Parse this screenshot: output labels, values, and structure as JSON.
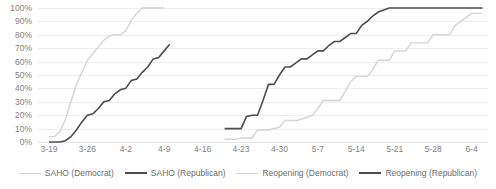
{
  "chart_data": {
    "type": "line",
    "title": "",
    "subtitle": "",
    "xlabel": "",
    "ylabel": "",
    "grid": true,
    "legend_position": "bottom",
    "ylim": [
      0,
      100
    ],
    "y_ticks": [
      "0%",
      "10%",
      "20%",
      "30%",
      "40%",
      "50%",
      "60%",
      "70%",
      "80%",
      "90%",
      "100%"
    ],
    "y_tick_values": [
      0,
      10,
      20,
      30,
      40,
      50,
      60,
      70,
      80,
      90,
      100
    ],
    "x_ticks": [
      "3-19",
      "3-26",
      "4-2",
      "4-9",
      "4-16",
      "4-23",
      "4-30",
      "5-7",
      "5-14",
      "5-21",
      "5-28",
      "6-4"
    ],
    "x_tick_values": [
      0,
      7,
      14,
      21,
      28,
      35,
      42,
      49,
      56,
      63,
      70,
      77
    ],
    "xlim": [
      -2,
      80
    ],
    "series": [
      {
        "name": "SAHO (Democrat)",
        "color": "#d4d4d4",
        "points": [
          [
            0,
            4
          ],
          [
            1,
            4
          ],
          [
            2,
            8
          ],
          [
            3,
            17
          ],
          [
            4,
            30
          ],
          [
            5,
            43
          ],
          [
            6,
            52
          ],
          [
            7,
            61
          ],
          [
            8,
            66
          ],
          [
            9,
            71
          ],
          [
            10,
            76
          ],
          [
            11,
            79
          ],
          [
            12,
            80
          ],
          [
            13,
            80
          ],
          [
            14,
            83
          ],
          [
            15,
            91
          ],
          [
            16,
            96
          ],
          [
            17,
            100
          ],
          [
            18,
            100
          ],
          [
            19,
            100
          ],
          [
            20,
            100
          ],
          [
            21,
            100
          ]
        ]
      },
      {
        "name": "SAHO (Republican)",
        "color": "#4d4d4d",
        "points": [
          [
            0,
            0
          ],
          [
            1,
            0
          ],
          [
            2,
            0
          ],
          [
            3,
            1
          ],
          [
            4,
            4
          ],
          [
            5,
            9
          ],
          [
            6,
            15
          ],
          [
            7,
            20
          ],
          [
            8,
            21
          ],
          [
            9,
            25
          ],
          [
            10,
            30
          ],
          [
            11,
            31
          ],
          [
            12,
            36
          ],
          [
            13,
            39
          ],
          [
            14,
            40
          ],
          [
            15,
            46
          ],
          [
            16,
            47
          ],
          [
            17,
            52
          ],
          [
            18,
            56
          ],
          [
            19,
            62
          ],
          [
            20,
            63
          ],
          [
            21,
            68
          ],
          [
            22,
            73
          ]
        ]
      },
      {
        "name": "Reopening (Democrat)",
        "color": "#d4d4d4",
        "points": [
          [
            32,
            2
          ],
          [
            34,
            2
          ],
          [
            35,
            3
          ],
          [
            37,
            3
          ],
          [
            38,
            9
          ],
          [
            40,
            9
          ],
          [
            42,
            11
          ],
          [
            43,
            16
          ],
          [
            45,
            16
          ],
          [
            46,
            17
          ],
          [
            48,
            20
          ],
          [
            49,
            25
          ],
          [
            50,
            31
          ],
          [
            51,
            31
          ],
          [
            53,
            31
          ],
          [
            54,
            38
          ],
          [
            55,
            45
          ],
          [
            56,
            49
          ],
          [
            58,
            49
          ],
          [
            59,
            54
          ],
          [
            60,
            61
          ],
          [
            62,
            61
          ],
          [
            63,
            68
          ],
          [
            65,
            68
          ],
          [
            66,
            74
          ],
          [
            69,
            74
          ],
          [
            70,
            80
          ],
          [
            73,
            80
          ],
          [
            74,
            87
          ],
          [
            76,
            93
          ],
          [
            77,
            96
          ],
          [
            79,
            96
          ]
        ]
      },
      {
        "name": "Reopening (Republican)",
        "color": "#4d4d4d",
        "points": [
          [
            32,
            10
          ],
          [
            34,
            10
          ],
          [
            35,
            10
          ],
          [
            36,
            19
          ],
          [
            37,
            20
          ],
          [
            38,
            20
          ],
          [
            39,
            31
          ],
          [
            40,
            43
          ],
          [
            41,
            43
          ],
          [
            42,
            50
          ],
          [
            43,
            56
          ],
          [
            44,
            56
          ],
          [
            45,
            59
          ],
          [
            46,
            62
          ],
          [
            47,
            62
          ],
          [
            48,
            65
          ],
          [
            49,
            68
          ],
          [
            50,
            68
          ],
          [
            51,
            72
          ],
          [
            52,
            75
          ],
          [
            53,
            75
          ],
          [
            54,
            78
          ],
          [
            55,
            81
          ],
          [
            56,
            81
          ],
          [
            57,
            87
          ],
          [
            58,
            90
          ],
          [
            59,
            94
          ],
          [
            60,
            97
          ],
          [
            62,
            100
          ],
          [
            65,
            100
          ],
          [
            70,
            100
          ],
          [
            75,
            100
          ],
          [
            79,
            100
          ]
        ]
      }
    ],
    "legend": [
      {
        "label": "SAHO (Democrat)",
        "style": "dem"
      },
      {
        "label": "SAHO (Republican)",
        "style": "rep"
      },
      {
        "label": "Reopening (Democrat)",
        "style": "dem"
      },
      {
        "label": "Reopening (Republican)",
        "style": "rep"
      }
    ]
  }
}
